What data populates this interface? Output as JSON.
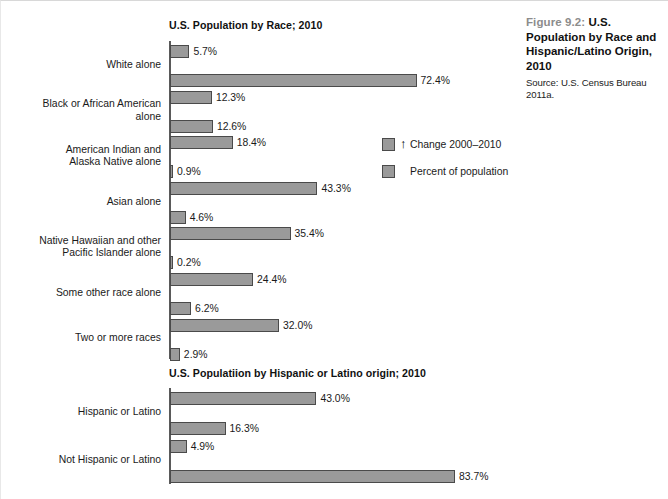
{
  "caption": {
    "figure_number": "Figure 9.2:",
    "title": "U.S. Population by Race and Hispanic/Latino Origin, 2010",
    "source": "Source: U.S. Census Bureau 2011a."
  },
  "legend": {
    "arrow_glyph": "↑",
    "items": [
      {
        "label": "Change 2000–2010",
        "color": "#9a9a9a",
        "has_arrow": true
      },
      {
        "label": "Percent of population",
        "color": "#9a9a9a",
        "has_arrow": false
      }
    ]
  },
  "chart_data": [
    {
      "type": "bar",
      "title": "U.S. Population by Race; 2010",
      "orientation": "horizontal",
      "xlabel": "",
      "ylabel": "",
      "xlim": [
        0,
        100
      ],
      "grid": false,
      "legend_position": "right",
      "categories": [
        "White alone",
        "Black or African American alone",
        "American Indian and Alaska Native alone",
        "Asian alone",
        "Native Hawaiian and other Pacific Islander alone",
        "Some other race alone",
        "Two or more races"
      ],
      "series": [
        {
          "name": "Change 2000–2010",
          "values": [
            5.7,
            12.3,
            18.4,
            43.3,
            35.4,
            24.4,
            32.0
          ],
          "labels": [
            "5.7%",
            "12.3%",
            "18.4%",
            "43.3%",
            "35.4%",
            "24.4%",
            "32.0%"
          ]
        },
        {
          "name": "Percent of population",
          "values": [
            72.4,
            12.6,
            0.9,
            4.6,
            0.2,
            6.2,
            2.9
          ],
          "labels": [
            "72.4%",
            "12.6%",
            "0.9%",
            "4.6%",
            "0.2%",
            "6.2%",
            "2.9%"
          ]
        }
      ]
    },
    {
      "type": "bar",
      "title": "U.S. Populatiion by Hispanic or Latino origin; 2010",
      "orientation": "horizontal",
      "xlabel": "",
      "ylabel": "",
      "xlim": [
        0,
        100
      ],
      "grid": false,
      "legend_position": "none",
      "categories": [
        "Hispanic or Latino",
        "Not Hispanic or Latino"
      ],
      "series": [
        {
          "name": "Change 2000–2010",
          "values": [
            43.0,
            4.9
          ],
          "labels": [
            "43.0%",
            "4.9%"
          ]
        },
        {
          "name": "Percent of population",
          "values": [
            16.3,
            83.7
          ],
          "labels": [
            "16.3%",
            "83.7%"
          ]
        }
      ]
    }
  ],
  "colors": {
    "bar_fill": "#9a9a9a",
    "bar_stroke": "#4a4a4a",
    "axis": "#5a5a5a",
    "text": "#1a1a1a",
    "figure_number": "#8c8c8c"
  }
}
